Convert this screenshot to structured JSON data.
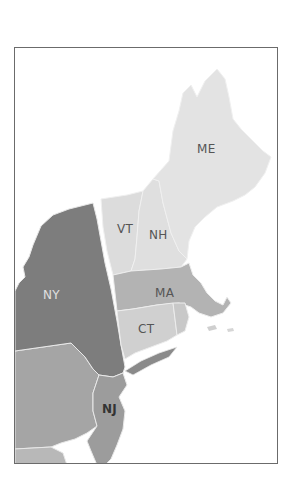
{
  "map": {
    "title": "",
    "states": [
      {
        "code": "ME",
        "label": "ME",
        "fill": "#e3e3e3",
        "label_color": "#555555",
        "label_x": 196,
        "label_y": 152
      },
      {
        "code": "VT",
        "label": "VT",
        "fill": "#dcdcdc",
        "label_color": "#555555",
        "label_x": 116,
        "label_y": 232
      },
      {
        "code": "NH",
        "label": "NH",
        "fill": "#dfdfdf",
        "label_color": "#555555",
        "label_x": 148,
        "label_y": 238
      },
      {
        "code": "NY",
        "label": "NY",
        "fill": "#7d7d7d",
        "label_color": "#dddddd",
        "label_x": 42,
        "label_y": 297
      },
      {
        "code": "MA",
        "label": "MA",
        "fill": "#b3b3b3",
        "label_color": "#555555",
        "label_x": 154,
        "label_y": 296
      },
      {
        "code": "CT",
        "label": "CT",
        "fill": "#d0d0d0",
        "label_color": "#555555",
        "label_x": 137,
        "label_y": 332
      },
      {
        "code": "NJ",
        "label": "NJ",
        "fill": "#9c9c9c",
        "label_color": "#333333",
        "label_x": 101,
        "label_y": 412
      },
      {
        "code": "PA",
        "label": "",
        "fill": "#a5a5a5",
        "label_color": "#333333"
      },
      {
        "code": "RI",
        "label": "",
        "fill": "#c8c8c8",
        "label_color": "#333333"
      }
    ],
    "frame_color": "#6b6b6b",
    "background": "#ffffff"
  }
}
